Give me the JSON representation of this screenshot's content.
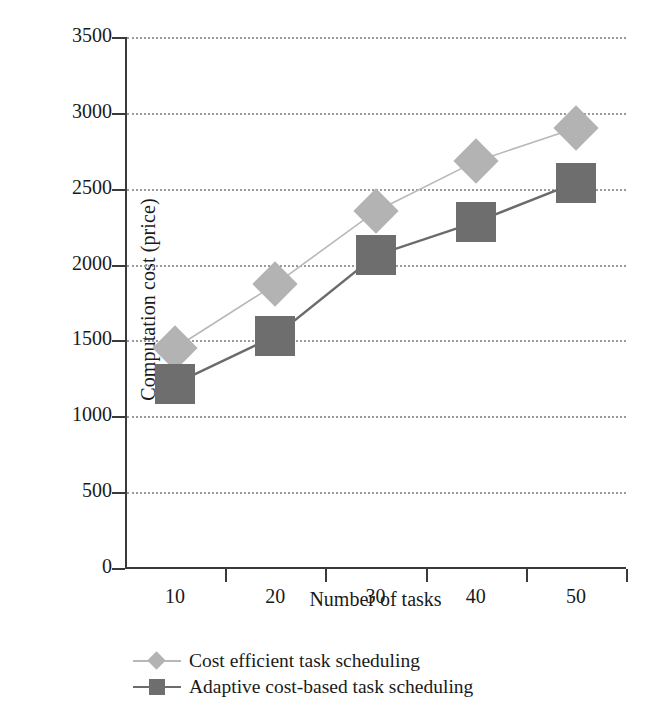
{
  "chart_data": {
    "type": "line",
    "title": "",
    "xlabel": "Number of tasks",
    "ylabel": "Computation cost (price)",
    "categories": [
      "10",
      "20",
      "30",
      "40",
      "50"
    ],
    "x": [
      10,
      20,
      30,
      40,
      50
    ],
    "ylim": [
      0,
      3500
    ],
    "yticks": [
      "0",
      "500",
      "1000",
      "1500",
      "2000",
      "2500",
      "3000",
      "3500"
    ],
    "ytick_values": [
      0,
      500,
      1000,
      1500,
      2000,
      2500,
      3000,
      3500
    ],
    "grid": "horizontal-dotted",
    "legend_position": "below-axis-left",
    "series": [
      {
        "name": "Cost efficient task scheduling",
        "marker": "diamond",
        "color": "#b3b3b3",
        "line_color": "#b8b8b8",
        "values": [
          1450,
          1870,
          2350,
          2680,
          2900
        ]
      },
      {
        "name": "Adaptive cost-based task scheduling",
        "marker": "square",
        "color": "#6e6e6e",
        "line_color": "#6b6b6b",
        "values": [
          1215,
          1530,
          2060,
          2280,
          2540
        ]
      }
    ]
  },
  "axis": {
    "spine_color": "#3a3a3a",
    "grid_color": "#9a9aa2"
  },
  "legend": {
    "entries": [
      {
        "label": "Cost efficient task scheduling"
      },
      {
        "label": "Adaptive cost-based task scheduling"
      }
    ]
  }
}
